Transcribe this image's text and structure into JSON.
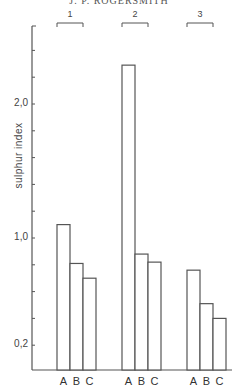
{
  "running_head": "J. P. ROGERSMITH",
  "chart_data": {
    "type": "bar",
    "title": "",
    "xlabel": "",
    "ylabel": "sulphur index",
    "ylim": [
      0,
      2.6
    ],
    "grid": false,
    "legend": null,
    "y_tick_labels": [
      "2,0",
      "1,0",
      "0,2"
    ],
    "y_tick_values": [
      2.0,
      1.0,
      0.2
    ],
    "minor_tick_interval": 0.2,
    "groups": [
      "1",
      "2",
      "3"
    ],
    "categories": [
      "A",
      "B",
      "C"
    ],
    "series": [
      {
        "name": "1",
        "values": [
          1.1,
          0.81,
          0.7
        ]
      },
      {
        "name": "2",
        "values": [
          2.29,
          0.88,
          0.82
        ]
      },
      {
        "name": "3",
        "values": [
          0.76,
          0.51,
          0.4
        ]
      }
    ]
  }
}
